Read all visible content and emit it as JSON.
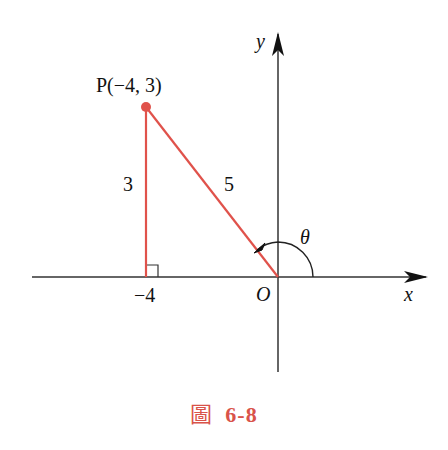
{
  "figure": {
    "caption_prefix": "圖",
    "caption_number": "6-8",
    "colors": {
      "accent": "#e0524b",
      "axis": "#222222",
      "caption": "#d9534a"
    }
  },
  "axes": {
    "x_label": "x",
    "y_label": "y",
    "origin_label": "O"
  },
  "point": {
    "label": "P(−4, 3)",
    "x": -4,
    "y": 3
  },
  "triangle": {
    "vertical_side_label": "3",
    "hypotenuse_label": "5",
    "foot_label": "−4"
  },
  "angle": {
    "label": "θ"
  }
}
